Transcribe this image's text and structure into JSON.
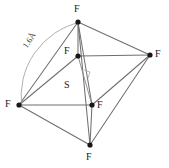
{
  "figure": {
    "name": "sulfur-hexafluoride-octahedron",
    "background_color": "#ffffff",
    "bond_color": "#6f6f6f",
    "atom_color": "#171717",
    "label_color": "#1a1a1a",
    "width": 169,
    "height": 168
  },
  "atoms": [
    {
      "id": "f-top",
      "element": "F",
      "x": 78,
      "y": 22,
      "label_x": 74,
      "label_y": 4
    },
    {
      "id": "f-right",
      "element": "F",
      "x": 150,
      "y": 55,
      "label_x": 155,
      "label_y": 49
    },
    {
      "id": "f-left",
      "element": "F",
      "x": 19,
      "y": 105,
      "label_x": 5,
      "label_y": 99
    },
    {
      "id": "f-bottom",
      "element": "F",
      "x": 90,
      "y": 145,
      "label_x": 86,
      "label_y": 152
    },
    {
      "id": "f-inner-upper",
      "element": "F",
      "x": 78,
      "y": 56,
      "label_x": 64,
      "label_y": 46
    },
    {
      "id": "f-inner-lower",
      "element": "F",
      "x": 92,
      "y": 105,
      "label_x": 97,
      "label_y": 100
    }
  ],
  "center_atom": {
    "id": "s-center",
    "element": "S",
    "label_x": 64,
    "label_y": 80
  },
  "bonds": [
    {
      "from": "f-left",
      "to": "f-top",
      "style": "solid"
    },
    {
      "from": "f-left",
      "to": "f-inner-upper",
      "style": "solid"
    },
    {
      "from": "f-left",
      "to": "f-inner-lower",
      "style": "solid"
    },
    {
      "from": "f-left",
      "to": "f-bottom",
      "style": "solid"
    },
    {
      "from": "f-top",
      "to": "f-inner-upper",
      "style": "solid"
    },
    {
      "from": "f-top",
      "to": "f-right",
      "style": "solid"
    },
    {
      "from": "f-top",
      "to": "f-bottom",
      "style": "solid"
    },
    {
      "from": "f-top",
      "to": "f-inner-lower",
      "style": "solid"
    },
    {
      "from": "f-inner-upper",
      "to": "f-right",
      "style": "solid"
    },
    {
      "from": "f-inner-upper",
      "to": "f-inner-lower",
      "style": "thin"
    },
    {
      "from": "f-right",
      "to": "f-inner-lower",
      "style": "solid"
    },
    {
      "from": "f-right",
      "to": "f-bottom",
      "style": "solid"
    },
    {
      "from": "f-inner-lower",
      "to": "f-bottom",
      "style": "solid"
    }
  ],
  "measurement": {
    "id": "bond-length-arc",
    "text": "1.6Å",
    "value": "1.6",
    "unit": "Å",
    "label_x": 25,
    "label_y": 43,
    "label_rotation": -58,
    "arc_path": "M 22 108 A 76 76 0 0 1 81 22"
  },
  "right_angle_marker": {
    "id": "right-angle-mark",
    "path": "M 84 70 L 90 72 L 88 78"
  }
}
